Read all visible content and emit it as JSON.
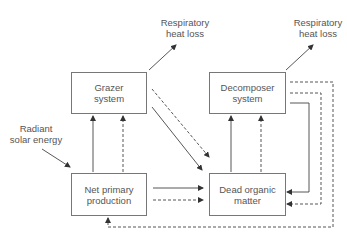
{
  "diagram": {
    "nodes": {
      "grazer": {
        "line1": "Grazer",
        "line2": "system"
      },
      "decomposer": {
        "line1": "Decomposer",
        "line2": "system"
      },
      "npp": {
        "line1": "Net primary",
        "line2": "production"
      },
      "dom": {
        "line1": "Dead organic",
        "line2": "matter"
      }
    },
    "labels": {
      "resp_grazer": {
        "line1": "Respiratory",
        "line2": "heat loss"
      },
      "resp_decomposer": {
        "line1": "Respiratory",
        "line2": "heat loss"
      },
      "solar": {
        "line1": "Radiant",
        "line2": "solar energy"
      }
    },
    "edges": [
      {
        "from": "Radiant solar energy",
        "to": "Net primary production",
        "style": "solid"
      },
      {
        "from": "Net primary production",
        "to": "Grazer system",
        "style": "solid"
      },
      {
        "from": "Net primary production",
        "to": "Grazer system",
        "style": "dashed"
      },
      {
        "from": "Net primary production",
        "to": "Dead organic matter",
        "style": "solid"
      },
      {
        "from": "Net primary production",
        "to": "Dead organic matter",
        "style": "dashed"
      },
      {
        "from": "Grazer system",
        "to": "Respiratory heat loss",
        "style": "solid"
      },
      {
        "from": "Grazer system",
        "to": "Dead organic matter",
        "style": "solid"
      },
      {
        "from": "Grazer system",
        "to": "Dead organic matter",
        "style": "dashed"
      },
      {
        "from": "Dead organic matter",
        "to": "Decomposer system",
        "style": "solid"
      },
      {
        "from": "Dead organic matter",
        "to": "Decomposer system",
        "style": "dashed"
      },
      {
        "from": "Decomposer system",
        "to": "Respiratory heat loss",
        "style": "solid"
      },
      {
        "from": "Decomposer system",
        "to": "Dead organic matter",
        "style": "solid"
      },
      {
        "from": "Decomposer system",
        "to": "Dead organic matter",
        "style": "dashed"
      },
      {
        "from": "Decomposer system",
        "to": "Net primary production",
        "style": "dashed"
      }
    ]
  }
}
